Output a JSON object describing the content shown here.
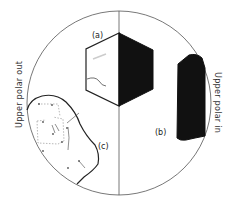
{
  "diagram": {
    "type": "microscope-field-of-view",
    "labels": {
      "a": "(a)",
      "b": "(b)",
      "c": "(c)"
    },
    "side_labels": {
      "left": "Upper polar out",
      "right": "Upper polar in"
    },
    "colors": {
      "line": "#222222",
      "fill_dark": "#111111",
      "background": "#ffffff",
      "dotted": "#999999"
    },
    "elements": [
      {
        "id": "a",
        "description": "hexagonal crystal, left half clear, right half dark (extinct)"
      },
      {
        "id": "b",
        "description": "opaque dark elongated grain"
      },
      {
        "id": "c",
        "description": "irregular grain outline with internal dotted boundaries"
      }
    ]
  }
}
